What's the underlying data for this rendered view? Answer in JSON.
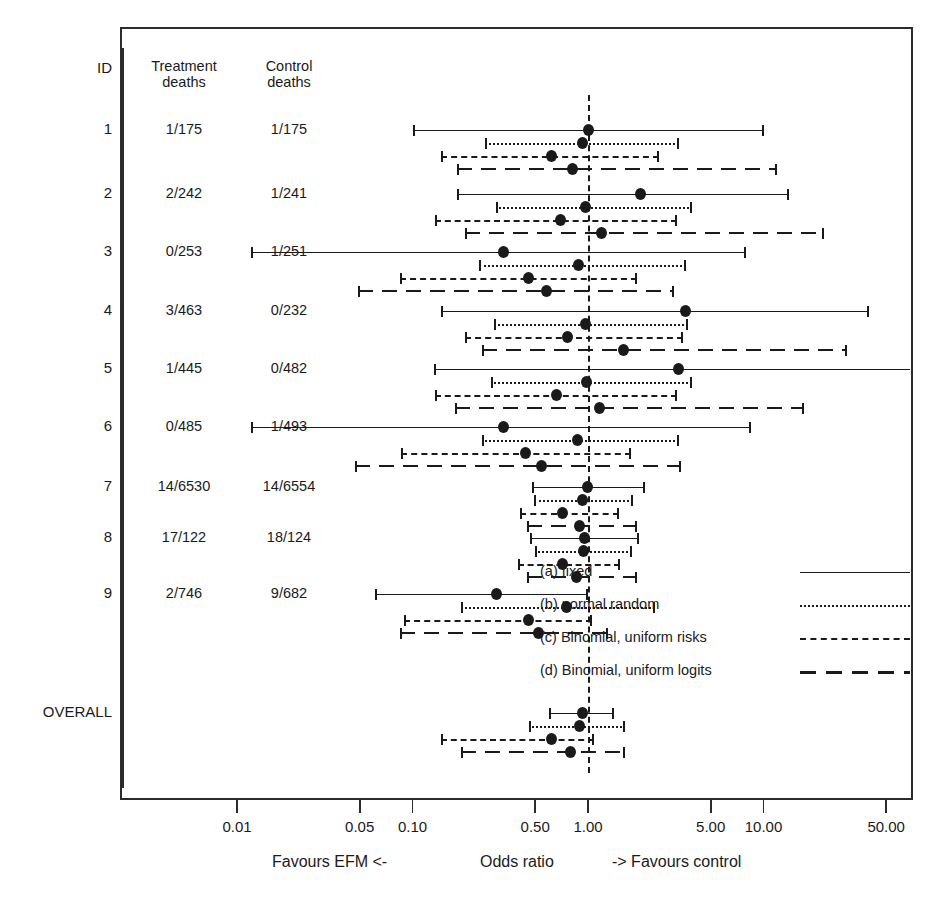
{
  "chart_data": {
    "type": "forest",
    "title": "",
    "xlabel": "Odds ratio",
    "ylabel": "",
    "xscale": "log",
    "xlim": [
      0.0065,
      75
    ],
    "grid": false,
    "null_value": 1.0,
    "axis": {
      "ticks": [
        0.01,
        0.05,
        0.1,
        0.5,
        1.0,
        5.0,
        10.0,
        50.0
      ],
      "tick_labels": [
        "0.01",
        "0.05",
        "0.10",
        "0.50",
        "1.00",
        "5.00",
        "10.00",
        "50.00"
      ],
      "left_caption": "Favours EFM  <-",
      "center_caption": "Odds ratio",
      "right_caption": "->  Favours control"
    },
    "columns": {
      "id": "ID",
      "treatment": "Treatment\ndeaths",
      "control": "Control\ndeaths"
    },
    "methods": [
      {
        "key": "a",
        "label": "(a) fixed",
        "style": "solid"
      },
      {
        "key": "b",
        "label": "(b) normal random",
        "style": "dotted"
      },
      {
        "key": "c",
        "label": "(c) Binomial, uniform risks",
        "style": "dashed"
      },
      {
        "key": "d",
        "label": "(d) Binomial, uniform logits",
        "style": "longdash"
      }
    ],
    "studies": [
      {
        "id": "1",
        "treatment": "1/175",
        "control": "1/175",
        "estimates": [
          {
            "method": "a",
            "or": 1.0,
            "lo": 0.1,
            "hi": 10.0,
            "lo_clipped": false,
            "hi_clipped": false
          },
          {
            "method": "b",
            "or": 0.93,
            "lo": 0.26,
            "hi": 3.3,
            "lo_clipped": false,
            "hi_clipped": false
          },
          {
            "method": "c",
            "or": 0.62,
            "lo": 0.145,
            "hi": 2.55,
            "lo_clipped": false,
            "hi_clipped": false
          },
          {
            "method": "d",
            "or": 0.82,
            "lo": 0.18,
            "hi": 12.0,
            "lo_clipped": false,
            "hi_clipped": false
          }
        ]
      },
      {
        "id": "2",
        "treatment": "2/242",
        "control": "1/241",
        "estimates": [
          {
            "method": "a",
            "or": 1.99,
            "lo": 0.18,
            "hi": 14.0,
            "lo_clipped": false,
            "hi_clipped": false
          },
          {
            "method": "b",
            "or": 0.97,
            "lo": 0.3,
            "hi": 3.9,
            "lo_clipped": false,
            "hi_clipped": false
          },
          {
            "method": "c",
            "or": 0.7,
            "lo": 0.135,
            "hi": 3.2,
            "lo_clipped": false,
            "hi_clipped": false
          },
          {
            "method": "d",
            "or": 1.2,
            "lo": 0.2,
            "hi": 22.0,
            "lo_clipped": false,
            "hi_clipped": false
          }
        ]
      },
      {
        "id": "3",
        "treatment": "0/253",
        "control": "1/251",
        "estimates": [
          {
            "method": "a",
            "or": 0.33,
            "lo": 0.012,
            "hi": 8.0,
            "lo_clipped": false,
            "hi_clipped": false
          },
          {
            "method": "b",
            "or": 0.88,
            "lo": 0.24,
            "hi": 3.6,
            "lo_clipped": false,
            "hi_clipped": false
          },
          {
            "method": "c",
            "or": 0.46,
            "lo": 0.085,
            "hi": 1.9,
            "lo_clipped": false,
            "hi_clipped": false
          },
          {
            "method": "d",
            "or": 0.58,
            "lo": 0.049,
            "hi": 3.1,
            "lo_clipped": false,
            "hi_clipped": false
          }
        ]
      },
      {
        "id": "4",
        "treatment": "3/463",
        "control": "0/232",
        "estimates": [
          {
            "method": "a",
            "or": 3.6,
            "lo": 0.145,
            "hi": 40.0,
            "lo_clipped": false,
            "hi_clipped": false
          },
          {
            "method": "b",
            "or": 0.97,
            "lo": 0.29,
            "hi": 3.7,
            "lo_clipped": false,
            "hi_clipped": false
          },
          {
            "method": "c",
            "or": 0.76,
            "lo": 0.2,
            "hi": 3.5,
            "lo_clipped": false,
            "hi_clipped": false
          },
          {
            "method": "d",
            "or": 1.6,
            "lo": 0.25,
            "hi": 30.0,
            "lo_clipped": false,
            "hi_clipped": false
          }
        ]
      },
      {
        "id": "5",
        "treatment": "1/445",
        "control": "0/482",
        "estimates": [
          {
            "method": "a",
            "or": 3.3,
            "lo": 0.132,
            "hi": 90.0,
            "lo_clipped": false,
            "hi_clipped": true
          },
          {
            "method": "b",
            "or": 0.98,
            "lo": 0.28,
            "hi": 3.9,
            "lo_clipped": false,
            "hi_clipped": false
          },
          {
            "method": "c",
            "or": 0.66,
            "lo": 0.135,
            "hi": 3.2,
            "lo_clipped": false,
            "hi_clipped": false
          },
          {
            "method": "d",
            "or": 1.16,
            "lo": 0.175,
            "hi": 17.0,
            "lo_clipped": false,
            "hi_clipped": false
          }
        ]
      },
      {
        "id": "6",
        "treatment": "0/485",
        "control": "1/493",
        "estimates": [
          {
            "method": "a",
            "or": 0.33,
            "lo": 0.012,
            "hi": 8.5,
            "lo_clipped": false,
            "hi_clipped": false
          },
          {
            "method": "b",
            "or": 0.87,
            "lo": 0.25,
            "hi": 3.3,
            "lo_clipped": false,
            "hi_clipped": false
          },
          {
            "method": "c",
            "or": 0.44,
            "lo": 0.086,
            "hi": 1.75,
            "lo_clipped": false,
            "hi_clipped": false
          },
          {
            "method": "d",
            "or": 0.54,
            "lo": 0.047,
            "hi": 3.4,
            "lo_clipped": false,
            "hi_clipped": false
          }
        ]
      },
      {
        "id": "7",
        "treatment": "14/6530",
        "control": "14/6554",
        "estimates": [
          {
            "method": "a",
            "or": 1.0,
            "lo": 0.48,
            "hi": 2.1,
            "lo_clipped": false,
            "hi_clipped": false
          },
          {
            "method": "b",
            "or": 0.93,
            "lo": 0.49,
            "hi": 1.8,
            "lo_clipped": false,
            "hi_clipped": false
          },
          {
            "method": "c",
            "or": 0.72,
            "lo": 0.41,
            "hi": 1.5,
            "lo_clipped": false,
            "hi_clipped": false
          },
          {
            "method": "d",
            "or": 0.9,
            "lo": 0.45,
            "hi": 1.9,
            "lo_clipped": false,
            "hi_clipped": false
          }
        ]
      },
      {
        "id": "8",
        "treatment": "17/122",
        "control": "18/124",
        "estimates": [
          {
            "method": "a",
            "or": 0.96,
            "lo": 0.47,
            "hi": 1.95,
            "lo_clipped": false,
            "hi_clipped": false
          },
          {
            "method": "b",
            "or": 0.94,
            "lo": 0.5,
            "hi": 1.78,
            "lo_clipped": false,
            "hi_clipped": false
          },
          {
            "method": "c",
            "or": 0.72,
            "lo": 0.4,
            "hi": 1.52,
            "lo_clipped": false,
            "hi_clipped": false
          },
          {
            "method": "d",
            "or": 0.86,
            "lo": 0.45,
            "hi": 1.9,
            "lo_clipped": false,
            "hi_clipped": false
          }
        ]
      },
      {
        "id": "9",
        "treatment": "2/746",
        "control": "9/682",
        "estimates": [
          {
            "method": "a",
            "or": 0.3,
            "lo": 0.061,
            "hi": 1.0,
            "lo_clipped": false,
            "hi_clipped": false
          },
          {
            "method": "b",
            "or": 0.75,
            "lo": 0.19,
            "hi": 2.4,
            "lo_clipped": false,
            "hi_clipped": false
          },
          {
            "method": "c",
            "or": 0.46,
            "lo": 0.09,
            "hi": 1.05,
            "lo_clipped": false,
            "hi_clipped": false
          },
          {
            "method": "d",
            "or": 0.52,
            "lo": 0.085,
            "hi": 1.3,
            "lo_clipped": false,
            "hi_clipped": false
          }
        ]
      }
    ],
    "overall": {
      "id": "OVERALL",
      "treatment": "",
      "control": "",
      "estimates": [
        {
          "method": "a",
          "or": 0.93,
          "lo": 0.6,
          "hi": 1.4,
          "lo_clipped": false,
          "hi_clipped": false
        },
        {
          "method": "b",
          "or": 0.9,
          "lo": 0.46,
          "hi": 1.62,
          "lo_clipped": false,
          "hi_clipped": false
        },
        {
          "method": "c",
          "or": 0.62,
          "lo": 0.145,
          "hi": 1.08,
          "lo_clipped": false,
          "hi_clipped": false
        },
        {
          "method": "d",
          "or": 0.8,
          "lo": 0.19,
          "hi": 1.62,
          "lo_clipped": false,
          "hi_clipped": false
        }
      ]
    }
  }
}
